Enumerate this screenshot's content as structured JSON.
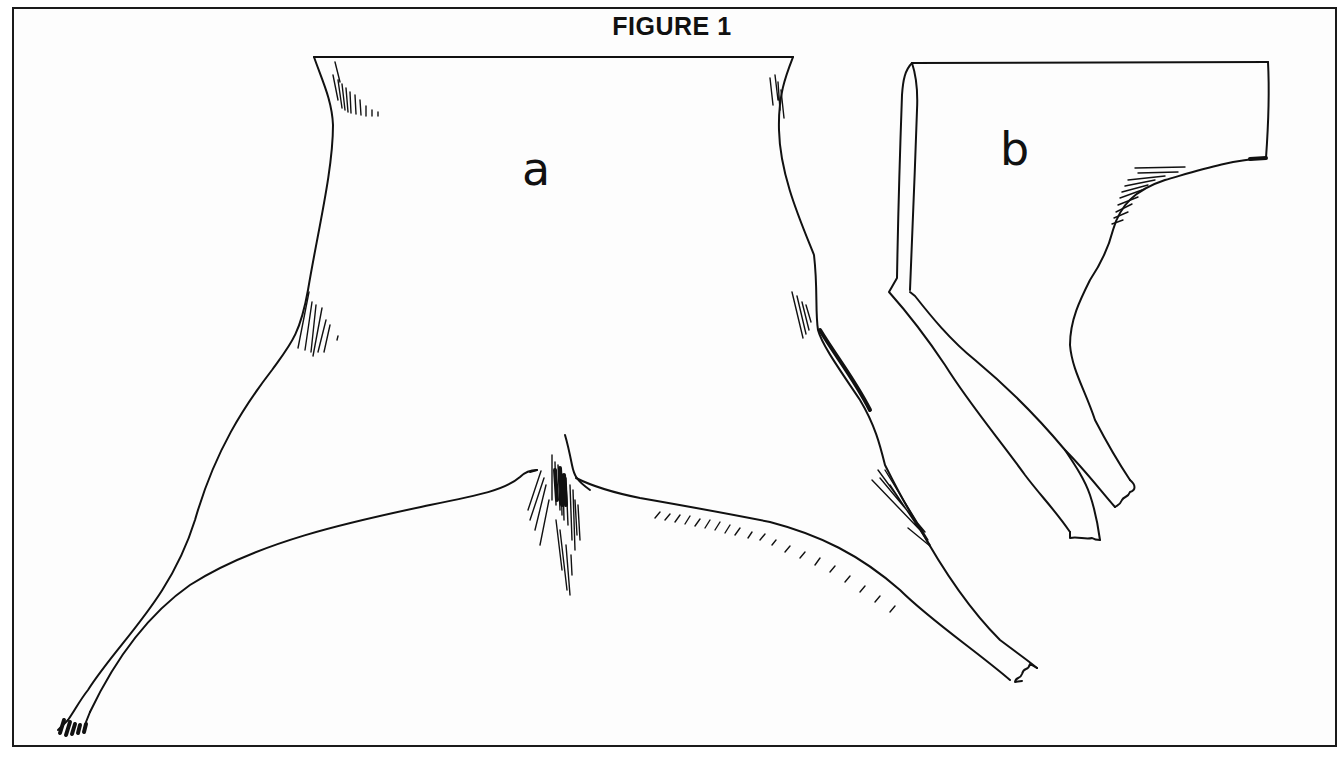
{
  "figure": {
    "title": "FIGURE 1",
    "border_color": "#1a1a1a",
    "ink_color": "#111111",
    "background": "#ffffff"
  },
  "panels": [
    {
      "id": "a",
      "label": "a",
      "description": "flat pelt outline, dorsal view with hind legs spread"
    },
    {
      "id": "b",
      "label": "b",
      "description": "folded pelt outline, side view"
    }
  ]
}
